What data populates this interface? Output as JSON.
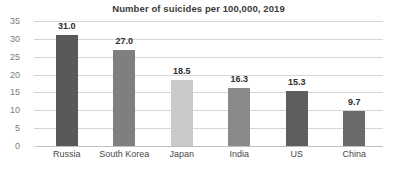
{
  "chart_data": {
    "type": "bar",
    "title": "Number of suicides per 100,000, 2019",
    "xlabel": "",
    "ylabel": "",
    "categories": [
      "Russia",
      "South Korea",
      "Japan",
      "India",
      "US",
      "China"
    ],
    "values": [
      31.0,
      27.0,
      18.5,
      16.3,
      15.3,
      9.7
    ],
    "value_labels": [
      "31.0",
      "27.0",
      "18.5",
      "16.3",
      "15.3",
      "9.7"
    ],
    "bar_colors": [
      "#595959",
      "#7f7f7f",
      "#c9c9c9",
      "#898989",
      "#5e5e5e",
      "#6b6b6b"
    ],
    "ylim": [
      0,
      35
    ],
    "ytick_values": [
      35,
      30,
      25,
      20,
      15,
      10,
      5,
      0
    ],
    "ytick_labels": [
      "35",
      "30",
      "25",
      "20",
      "15",
      "10",
      "5",
      "0"
    ],
    "grid": true,
    "grid_color": "#d6d6d6",
    "legend": null,
    "legend_position": "none",
    "background_color": "#ffffff",
    "title_color": "#3a3a3a",
    "tick_label_color": "#7a7a7a",
    "category_label_color": "#4a4a4a"
  }
}
